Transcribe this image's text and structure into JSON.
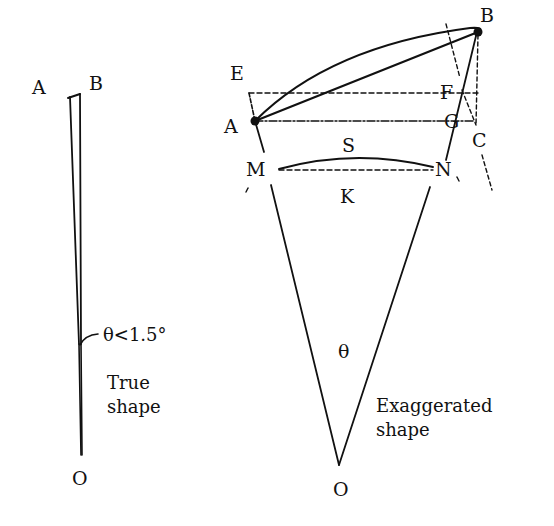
{
  "diagram": {
    "colors": {
      "ink": "#111111",
      "background": "#ffffff"
    },
    "left_figure": {
      "labels": {
        "A": "A",
        "B": "B",
        "O": "O"
      },
      "angle_annotation": "θ<1.5°",
      "caption_line1": "True",
      "caption_line2": "shape"
    },
    "right_figure": {
      "labels": {
        "A": "A",
        "B": "B",
        "C": "C",
        "E": "E",
        "F": "F",
        "G": "G",
        "M": "M",
        "N": "N",
        "S": "S",
        "K": "K",
        "O": "O"
      },
      "angle_label": "θ",
      "caption_line1": "Exaggerated",
      "caption_line2": "shape"
    }
  }
}
